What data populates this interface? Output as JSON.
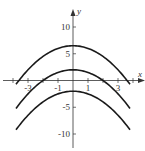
{
  "chart_data": {
    "type": "line",
    "title": "",
    "xlabel": "x",
    "ylabel": "y",
    "xlim": [
      -4.2,
      4.6
    ],
    "ylim": [
      -12,
      13
    ],
    "grid": false,
    "x_tick_labels": [
      "-3",
      "-1",
      "1",
      "3"
    ],
    "x_tick_values": [
      -3,
      -1,
      1,
      3
    ],
    "x_minor_ticks": [
      -4,
      -3,
      -2,
      -1,
      1,
      2,
      3,
      4
    ],
    "y_tick_labels": [
      "10",
      "5",
      "-5",
      "-10"
    ],
    "y_tick_values": [
      10,
      5,
      -5,
      -10
    ],
    "series": [
      {
        "name": "y = -x^2/2 + 6.5",
        "x": [
          -3.8,
          -3,
          -2,
          -1,
          0,
          1,
          2,
          3,
          3.8
        ],
        "values": [
          -0.72,
          2,
          4.5,
          6,
          6.5,
          6,
          4.5,
          2,
          -0.72
        ]
      },
      {
        "name": "y = -x^2/2 + 2",
        "x": [
          -3.8,
          -3,
          -2,
          -1,
          0,
          1,
          2,
          3,
          3.8
        ],
        "values": [
          -5.22,
          -2.5,
          0,
          1.5,
          2,
          1.5,
          0,
          -2.5,
          -5.22
        ]
      },
      {
        "name": "y = -x^2/2 - 2",
        "x": [
          -3.8,
          -3,
          -2,
          -1,
          0,
          1,
          2,
          3,
          3.8
        ],
        "values": [
          -9.22,
          -6.5,
          -4,
          -2.5,
          -2,
          -2.5,
          -4,
          -6.5,
          -9.22
        ]
      }
    ],
    "line_color": "#1a1a1a",
    "axis_color": "#333333"
  }
}
